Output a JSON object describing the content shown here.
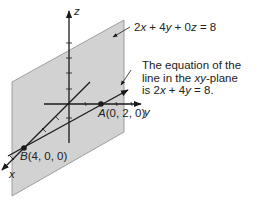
{
  "plane_equation": {
    "a": "2",
    "x": "x",
    "plus1": " + 4",
    "y": "y",
    "plus2": " + 0",
    "z": "z",
    "rhs": " = 8"
  },
  "note": {
    "line1": "The equation of the",
    "line2_pre": "line in the ",
    "line2_var": "xy",
    "line2_post": "-plane",
    "line3_pre": "is 2",
    "line3_x": "x",
    "line3_mid": " + 4",
    "line3_y": "y",
    "line3_post": " = 8."
  },
  "axes": {
    "x": "x",
    "y": "y",
    "z": "z"
  },
  "points": {
    "A": {
      "name": "A",
      "coords": "(0, 2, 0)"
    },
    "B": {
      "name": "B",
      "coords": "(4, 0, 0)"
    }
  },
  "colors": {
    "plane": "#d2d2d2",
    "plane_edge": "#8a8a8a",
    "ink": "#1a1a1a"
  }
}
